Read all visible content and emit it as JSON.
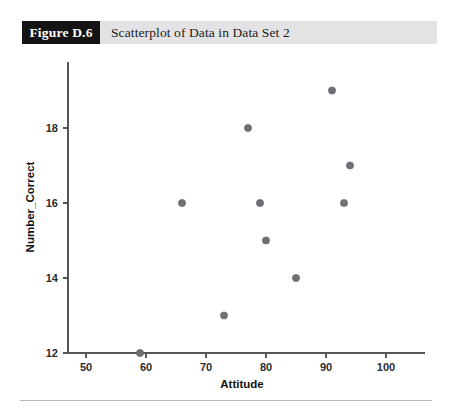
{
  "header": {
    "figure_number": "Figure D.6",
    "caption": "Scatterplot of Data in Data Set 2"
  },
  "chart_data": {
    "type": "scatter",
    "title": "Scatterplot of Data in Data Set 2",
    "xlabel": "Attitude",
    "ylabel": "Number_Correct",
    "xlim": [
      46,
      104
    ],
    "ylim": [
      12,
      19.8
    ],
    "xticks": [
      50,
      60,
      70,
      80,
      90,
      100
    ],
    "yticks": [
      12,
      14,
      16,
      18
    ],
    "xtick_labels": [
      "50",
      "60",
      "70",
      "80",
      "90",
      "100"
    ],
    "ytick_labels": [
      "12",
      "14",
      "16",
      "18"
    ],
    "grid": false,
    "legend": false,
    "marker_color": "#6f6f74",
    "points": [
      {
        "x": 59,
        "y": 12
      },
      {
        "x": 66,
        "y": 16
      },
      {
        "x": 73,
        "y": 13
      },
      {
        "x": 77,
        "y": 18
      },
      {
        "x": 79,
        "y": 16
      },
      {
        "x": 80,
        "y": 15
      },
      {
        "x": 85,
        "y": 14
      },
      {
        "x": 91,
        "y": 19
      },
      {
        "x": 93,
        "y": 16
      },
      {
        "x": 94,
        "y": 17
      }
    ]
  }
}
